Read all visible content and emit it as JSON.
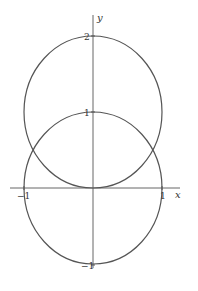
{
  "diagram": {
    "type": "polar-curves-plot",
    "axes": {
      "x_label": "x",
      "y_label": "y",
      "x_ticks": [
        "−1",
        "1"
      ],
      "y_ticks": [
        "2",
        "1",
        "−1"
      ]
    },
    "curves": [
      {
        "name": "upper-circle",
        "center": [
          0,
          1
        ],
        "radius": 1
      },
      {
        "name": "unit-circle",
        "center": [
          0,
          0
        ],
        "radius": 1
      }
    ],
    "colors": {
      "stroke": "#555555",
      "axis": "#666666",
      "background": "#ffffff"
    }
  }
}
